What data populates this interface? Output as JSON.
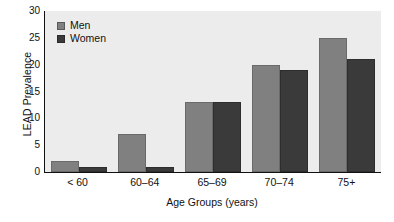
{
  "chart_data": {
    "type": "bar",
    "title": "",
    "xlabel": "Age Groups (years)",
    "ylabel": "LEAD Prevalence",
    "categories": [
      "< 60",
      "60–64",
      "65–69",
      "70–74",
      "75+"
    ],
    "series": [
      {
        "name": "Men",
        "color": "#808080",
        "values": [
          2,
          7,
          13,
          20,
          25
        ]
      },
      {
        "name": "Women",
        "color": "#3a3a3a",
        "values": [
          1,
          1,
          13,
          19,
          21
        ]
      }
    ],
    "ylim": [
      0,
      30
    ],
    "yticks": [
      0,
      5,
      10,
      15,
      20,
      25,
      30
    ],
    "ytick_labels": [
      "0",
      "5",
      "10",
      "15",
      "20",
      "25",
      "30"
    ],
    "grid": false,
    "legend_position": "top-left-inside",
    "plot_background": "#ececec",
    "figure_background": "#ffffff",
    "axis_color": "#111111"
  }
}
